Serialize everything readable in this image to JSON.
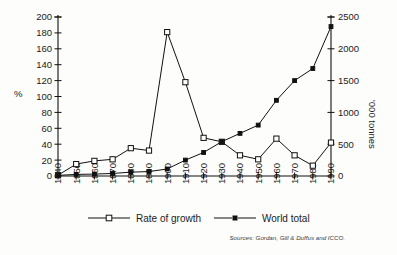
{
  "chart_data": {
    "type": "line",
    "title": "",
    "xlabel": "",
    "ylabel": "%",
    "y2label": "'000 tonnes",
    "x": [
      1840,
      1850,
      1860,
      1870,
      1880,
      1890,
      1900,
      1910,
      1920,
      1930,
      1940,
      1950,
      1960,
      1970,
      1980,
      1990
    ],
    "xtick_labels": [
      "1840",
      "1850",
      "1860",
      "1870",
      "1880",
      "1890",
      "1900",
      "1910",
      "1920",
      "1930",
      "1940",
      "1950",
      "1960",
      "1970",
      "1980",
      "1990"
    ],
    "ylim": [
      0,
      200
    ],
    "ytick_labels": [
      "0",
      "20",
      "40",
      "60",
      "80",
      "100",
      "120",
      "140",
      "160",
      "180",
      "200"
    ],
    "ytick_values": [
      0,
      20,
      40,
      60,
      80,
      100,
      120,
      140,
      160,
      180,
      200
    ],
    "y2lim": [
      0,
      2500
    ],
    "y2tick_labels": [
      "0",
      "500",
      "1000",
      "1500",
      "2000",
      "2500"
    ],
    "y2tick_values": [
      0,
      500,
      1000,
      1500,
      2000,
      2500
    ],
    "grid": false,
    "legend_position": "bottom",
    "series": [
      {
        "name": "Rate of growth",
        "axis": "left",
        "marker": "open-square",
        "values": [
          1,
          15,
          19,
          21,
          35,
          32,
          181,
          118,
          48,
          43,
          26,
          21,
          47,
          26,
          13,
          42
        ]
      },
      {
        "name": "World total",
        "axis": "right",
        "marker": "filled-square",
        "values": [
          10,
          25,
          30,
          40,
          60,
          70,
          110,
          250,
          370,
          540,
          670,
          800,
          1190,
          1500,
          1690,
          2350
        ]
      }
    ],
    "source_note": "Sources: Gordan, Gill & Duffus and ICCO.",
    "colors": {
      "line": "#111111",
      "marker_open_fill": "#ffffff",
      "marker_filled_fill": "#111111",
      "background": "#fdfdfb"
    }
  },
  "legend": {
    "items": [
      {
        "label": "Rate of growth",
        "marker": "open-square"
      },
      {
        "label": "World total",
        "marker": "filled-square"
      }
    ]
  }
}
